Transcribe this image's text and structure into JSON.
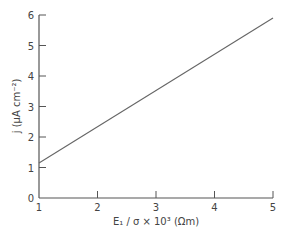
{
  "chart_data": {
    "type": "line",
    "title": "",
    "xlabel": "E₁ / σ × 10³ (Ωm)",
    "ylabel": "j (μA cm⁻²)",
    "xlim": [
      1,
      5
    ],
    "ylim": [
      0,
      6
    ],
    "xticks": [
      1,
      2,
      3,
      4,
      5
    ],
    "yticks": [
      0,
      1,
      2,
      3,
      4,
      5,
      6
    ],
    "grid": false,
    "legend": null,
    "series": [
      {
        "name": "j",
        "x": [
          1,
          5
        ],
        "y": [
          1.15,
          5.9
        ]
      }
    ]
  },
  "colors": {
    "axis": "#555555",
    "line": "#666666",
    "text": "#444444"
  }
}
